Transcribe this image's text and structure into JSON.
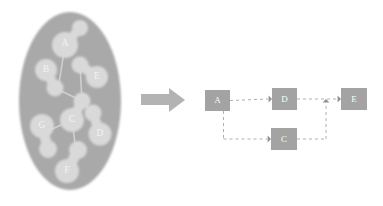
{
  "figure": {
    "width": 383,
    "height": 206,
    "background": "#ffffff"
  },
  "colors": {
    "blob_fill": "#a9a9a9",
    "cluster_fill": "#d9d9d9",
    "cluster_link": "#cfcfcf",
    "blob_label_text": "#f4f4f4",
    "arrow_fill": "#b3b3b3",
    "node_fill": "#a3a3a3",
    "node_label_text": "#fbfbfb",
    "edge_stroke": "#b0b0b0"
  },
  "left_panel": {
    "name": "clustered-graph-blob",
    "blob": {
      "shape": "ellipse",
      "cx": 70,
      "cy": 101,
      "rx": 51,
      "ry": 89
    },
    "clusters": [
      {
        "label": "A",
        "label_x": 65,
        "label_y": 44,
        "blobs": [
          {
            "cx": 65,
            "cy": 45,
            "r": 13
          },
          {
            "cx": 80,
            "cy": 28,
            "r": 8
          }
        ]
      },
      {
        "label": "B",
        "label_x": 46,
        "label_y": 70,
        "blobs": [
          {
            "cx": 46,
            "cy": 70,
            "r": 11
          },
          {
            "cx": 55,
            "cy": 88,
            "r": 8.5
          }
        ]
      },
      {
        "label": "E",
        "label_x": 97,
        "label_y": 77,
        "blobs": [
          {
            "cx": 97,
            "cy": 77,
            "r": 11
          },
          {
            "cx": 80,
            "cy": 65,
            "r": 8.5
          }
        ]
      },
      {
        "label": "C",
        "label_x": 72,
        "label_y": 120,
        "blobs": [
          {
            "cx": 72,
            "cy": 120,
            "r": 12
          },
          {
            "cx": 82,
            "cy": 101,
            "r": 8.5
          }
        ]
      },
      {
        "label": "G",
        "label_x": 42,
        "label_y": 126,
        "blobs": [
          {
            "cx": 42,
            "cy": 126,
            "r": 12
          },
          {
            "cx": 48,
            "cy": 149,
            "r": 9
          }
        ]
      },
      {
        "label": "D",
        "label_x": 100,
        "label_y": 134,
        "blobs": [
          {
            "cx": 100,
            "cy": 134,
            "r": 11.5
          },
          {
            "cx": 93,
            "cy": 113,
            "r": 8.5
          }
        ]
      },
      {
        "label": "F",
        "label_x": 67,
        "label_y": 171,
        "blobs": [
          {
            "cx": 67,
            "cy": 171,
            "r": 12
          },
          {
            "cx": 78,
            "cy": 150,
            "r": 9
          }
        ]
      }
    ],
    "inter_cluster_links": [
      {
        "x1": 65,
        "y1": 45,
        "x2": 58,
        "y2": 90
      },
      {
        "x1": 55,
        "y1": 88,
        "x2": 82,
        "y2": 101
      },
      {
        "x1": 82,
        "y1": 101,
        "x2": 80,
        "y2": 65
      },
      {
        "x1": 72,
        "y1": 120,
        "x2": 48,
        "y2": 131
      },
      {
        "x1": 72,
        "y1": 120,
        "x2": 76,
        "y2": 152
      },
      {
        "x1": 82,
        "y1": 101,
        "x2": 93,
        "y2": 113
      }
    ]
  },
  "transform_arrow": {
    "name": "transform-arrow",
    "tail_x": 141,
    "tail_y": 94,
    "tail_w": 28,
    "tail_h": 11,
    "head_x": 185,
    "head_y": 100,
    "head_half": 12
  },
  "right_panel": {
    "name": "abstracted-dag",
    "nodes": [
      {
        "id": "A",
        "label": "A",
        "x": 205,
        "y": 90,
        "w": 25,
        "h": 21
      },
      {
        "id": "D",
        "label": "D",
        "x": 272,
        "y": 88,
        "w": 25,
        "h": 22
      },
      {
        "id": "E",
        "label": "E",
        "x": 341,
        "y": 88,
        "w": 26,
        "h": 22
      },
      {
        "id": "C",
        "label": "C",
        "x": 271,
        "y": 128,
        "w": 26,
        "h": 22
      }
    ],
    "edges": [
      {
        "from": "A",
        "to": "D",
        "style": "dashed",
        "arrow": "end"
      },
      {
        "from": "D",
        "to": "E",
        "style": "dashed",
        "arrow": "end"
      },
      {
        "from": "A",
        "to": "C",
        "style": "dashed",
        "arrow": "end"
      },
      {
        "from": "C",
        "to": "E",
        "style": "dashed",
        "arrow": "end"
      }
    ]
  }
}
